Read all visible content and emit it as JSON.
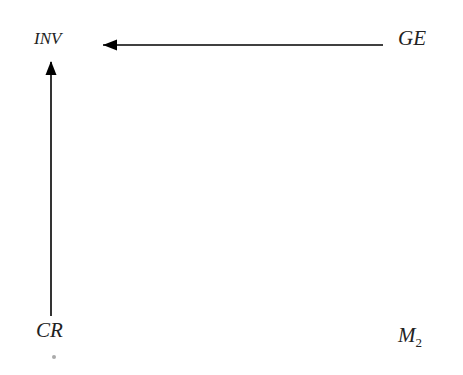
{
  "diagram": {
    "nodes": [
      {
        "id": "inv",
        "label": "INV"
      },
      {
        "id": "ge",
        "label": "GE"
      },
      {
        "id": "cr",
        "label": "CR"
      },
      {
        "id": "m2",
        "label": "M",
        "subscript": "2"
      }
    ],
    "edges": [
      {
        "from": "GE",
        "to": "INV",
        "style": "arrow"
      },
      {
        "from": "CR",
        "to": "INV",
        "style": "arrow"
      }
    ]
  }
}
